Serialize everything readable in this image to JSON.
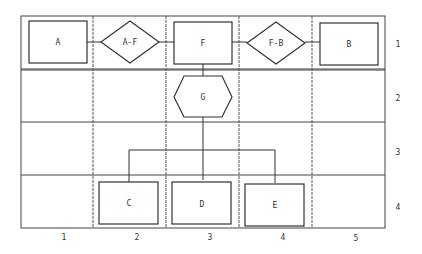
{
  "diagram": {
    "type": "entity-relationship grid diagram",
    "grid": {
      "columns": 5,
      "rows": 4
    },
    "column_labels": [
      "1",
      "2",
      "3",
      "4",
      "5"
    ],
    "row_labels": [
      "1",
      "2",
      "3",
      "4"
    ],
    "nodes": [
      {
        "id": "A",
        "label": "A",
        "shape": "rectangle",
        "col": 1,
        "row": 1
      },
      {
        "id": "A-F",
        "label": "A-F",
        "shape": "diamond",
        "col": 2,
        "row": 1
      },
      {
        "id": "F",
        "label": "F",
        "shape": "rectangle",
        "col": 3,
        "row": 1
      },
      {
        "id": "F-B",
        "label": "F-B",
        "shape": "diamond",
        "col": 4,
        "row": 1
      },
      {
        "id": "B",
        "label": "B",
        "shape": "rectangle",
        "col": 5,
        "row": 1
      },
      {
        "id": "G",
        "label": "G",
        "shape": "hexagon",
        "col": 3,
        "row": 2
      },
      {
        "id": "C",
        "label": "C",
        "shape": "rectangle",
        "col": 2,
        "row": 4
      },
      {
        "id": "D",
        "label": "D",
        "shape": "rectangle",
        "col": 3,
        "row": 4
      },
      {
        "id": "E",
        "label": "E",
        "shape": "rectangle",
        "col": 4,
        "row": 4
      }
    ],
    "edges": [
      {
        "from": "A",
        "to": "A-F"
      },
      {
        "from": "A-F",
        "to": "F"
      },
      {
        "from": "F",
        "to": "F-B"
      },
      {
        "from": "F-B",
        "to": "B"
      },
      {
        "from": "F",
        "to": "G"
      },
      {
        "from": "G",
        "to": "C"
      },
      {
        "from": "G",
        "to": "D"
      },
      {
        "from": "G",
        "to": "E"
      }
    ]
  }
}
